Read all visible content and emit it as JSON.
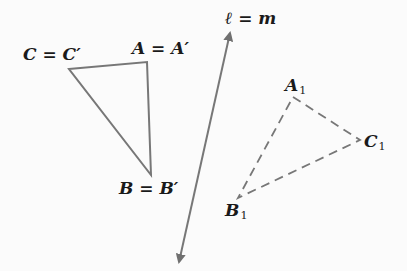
{
  "diagram": {
    "line_label": "ℓ = m",
    "original_triangle": {
      "vertices": {
        "A": {
          "label": "A = A′",
          "x": 147,
          "y": 62
        },
        "B": {
          "label": "B = B′",
          "x": 151,
          "y": 175
        },
        "C": {
          "label": "C = C′",
          "x": 69,
          "y": 69
        }
      },
      "stroke": "#777777",
      "style": "solid"
    },
    "reflected_triangle": {
      "vertices": {
        "A1": {
          "label": "A",
          "sub": "1",
          "x": 293,
          "y": 97
        },
        "B1": {
          "label": "B",
          "sub": "1",
          "x": 238,
          "y": 198
        },
        "C1": {
          "label": "C",
          "sub": "1",
          "x": 360,
          "y": 140
        }
      },
      "stroke": "#777777",
      "style": "dashed"
    },
    "line": {
      "start": {
        "x": 230,
        "y": 33
      },
      "end": {
        "x": 179,
        "y": 262
      },
      "arrows": "both",
      "stroke": "#777777"
    }
  }
}
